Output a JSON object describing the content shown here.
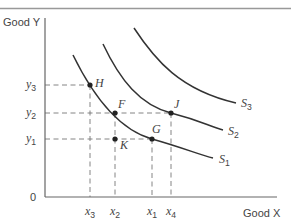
{
  "axes": {
    "y_label": "Good Y",
    "x_label": "Good X",
    "origin_label": "0"
  },
  "y_ticks": [
    {
      "base": "y",
      "sub": "3",
      "y": 85
    },
    {
      "base": "y",
      "sub": "2",
      "y": 113
    },
    {
      "base": "y",
      "sub": "1",
      "y": 139
    }
  ],
  "x_ticks": [
    {
      "base": "x",
      "sub": "3",
      "x": 90
    },
    {
      "base": "x",
      "sub": "2",
      "x": 115
    },
    {
      "base": "x",
      "sub": "1",
      "x": 152
    },
    {
      "base": "x",
      "sub": "4",
      "x": 171
    }
  ],
  "curves": [
    {
      "name": "S1",
      "base": "S",
      "sub": "1",
      "path": "M73,55 C95,100 120,130 152,139 S200,155 213,158",
      "label_x": 219,
      "label_y": 163
    },
    {
      "name": "S2",
      "base": "S",
      "sub": "2",
      "path": "M103,44 C120,80 140,105 171,113 S208,126 223,130",
      "label_x": 228,
      "label_y": 135
    },
    {
      "name": "S3",
      "base": "S",
      "sub": "3",
      "path": "M134,28 C155,60 180,90 236,103",
      "label_x": 241,
      "label_y": 107
    }
  ],
  "points": [
    {
      "name": "H",
      "x": 90,
      "y": 85,
      "label_dx": 5,
      "label_dy": 2
    },
    {
      "name": "F",
      "x": 115,
      "y": 113,
      "label_dx": 3,
      "label_dy": -5
    },
    {
      "name": "J",
      "x": 171,
      "y": 113,
      "label_dx": 3,
      "label_dy": -5
    },
    {
      "name": "G",
      "x": 152,
      "y": 139,
      "label_dx": 0,
      "label_dy": -6
    },
    {
      "name": "K",
      "x": 115,
      "y": 139,
      "label_dx": 5,
      "label_dy": 10
    }
  ],
  "guides": {
    "horizontal": [
      {
        "y": 85,
        "x_end": 90
      },
      {
        "y": 113,
        "x_end": 171
      },
      {
        "y": 139,
        "x_end": 152
      }
    ],
    "vertical": [
      {
        "x": 90,
        "y_start": 85
      },
      {
        "x": 115,
        "y_start": 113
      },
      {
        "x": 152,
        "y_start": 139
      },
      {
        "x": 171,
        "y_start": 113
      }
    ]
  },
  "colors": {
    "curve": "#333333",
    "axis": "#666666",
    "guide": "#777777",
    "point": "#222222",
    "top_rule": "#999999"
  }
}
